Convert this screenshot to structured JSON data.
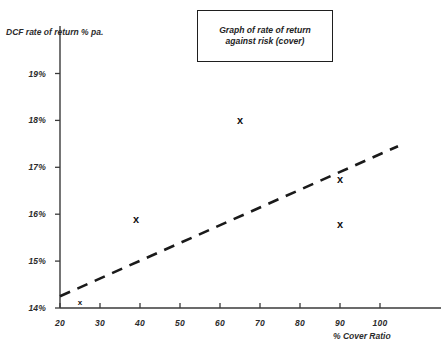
{
  "title_box": {
    "text": "Graph of rate of return against risk (cover)"
  },
  "chart_data": {
    "type": "scatter",
    "title": "Graph of rate of return against risk (cover)",
    "xlabel": "% Cover Ratio",
    "ylabel": "DCF rate of return % pa.",
    "xlim": [
      20,
      104.5
    ],
    "ylim": [
      14,
      19.2
    ],
    "grid": false,
    "legend": "none",
    "x_ticks": [
      20,
      30,
      40,
      50,
      60,
      70,
      80,
      90,
      100
    ],
    "x_tick_labels": [
      "20",
      "30",
      "40",
      "50",
      "60",
      "70",
      "80",
      "90",
      "100"
    ],
    "y_ticks": [
      14,
      15,
      16,
      17,
      18,
      19
    ],
    "y_tick_labels": [
      "14%",
      "15%",
      "16%",
      "17%",
      "18%",
      "19%"
    ],
    "series": [
      {
        "name": "observations",
        "marker": "x",
        "points": [
          {
            "x": 25,
            "y": 14.1,
            "marker_size": "small"
          },
          {
            "x": 39,
            "y": 15.9,
            "marker_size": "large"
          },
          {
            "x": 65,
            "y": 18.0,
            "marker_size": "large"
          },
          {
            "x": 90,
            "y": 16.75,
            "marker_size": "large"
          },
          {
            "x": 90,
            "y": 15.8,
            "marker_size": "large"
          }
        ]
      },
      {
        "name": "trend-line",
        "style": "dashed",
        "points": [
          {
            "x": 20,
            "y": 14.25
          },
          {
            "x": 104.5,
            "y": 17.45
          }
        ]
      }
    ],
    "colors": {
      "axis": "#3a3a3a",
      "marker": "#111111",
      "trend_line": "#1a1a1a",
      "background": "#ffffff"
    }
  }
}
